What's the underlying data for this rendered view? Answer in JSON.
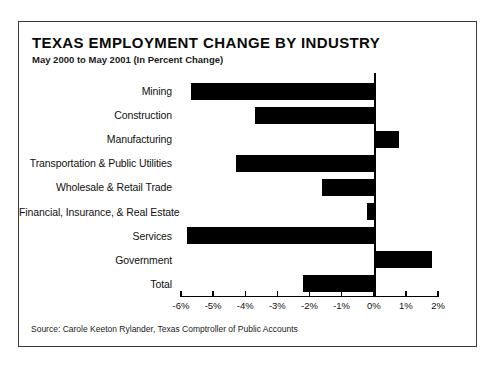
{
  "header": {
    "title": "TEXAS EMPLOYMENT CHANGE BY INDUSTRY",
    "subtitle": "May 2000 to May 2001 (In Percent Change)"
  },
  "chart_data": {
    "type": "bar",
    "orientation": "horizontal",
    "title": "TEXAS EMPLOYMENT CHANGE BY INDUSTRY",
    "subtitle": "May 2000 to May 2001 (In Percent Change)",
    "categories": [
      "Mining",
      "Construction",
      "Manufacturing",
      "Transportation & Public Utilities",
      "Wholesale & Retail Trade",
      "Financial, Insurance, & Real Estate",
      "Services",
      "Government",
      "Total"
    ],
    "values": [
      -5.7,
      -3.7,
      0.8,
      -4.3,
      -1.6,
      -0.2,
      -5.8,
      1.8,
      -2.2
    ],
    "xlabel": "",
    "ylabel": "",
    "xlim": [
      -6,
      2
    ],
    "x_tick_values": [
      -6,
      -5,
      -4,
      -3,
      -2,
      -1,
      0,
      1,
      2
    ],
    "x_tick_labels": [
      "-6%",
      "-5%",
      "-4%",
      "-3%",
      "-2%",
      "-1%",
      "0%",
      "1%",
      "2%"
    ],
    "grid": false,
    "legend": false,
    "bar_color": "#000000"
  },
  "footer": {
    "source": "Source: Carole Keeton Rylander, Texas Comptroller of Public Accounts"
  }
}
